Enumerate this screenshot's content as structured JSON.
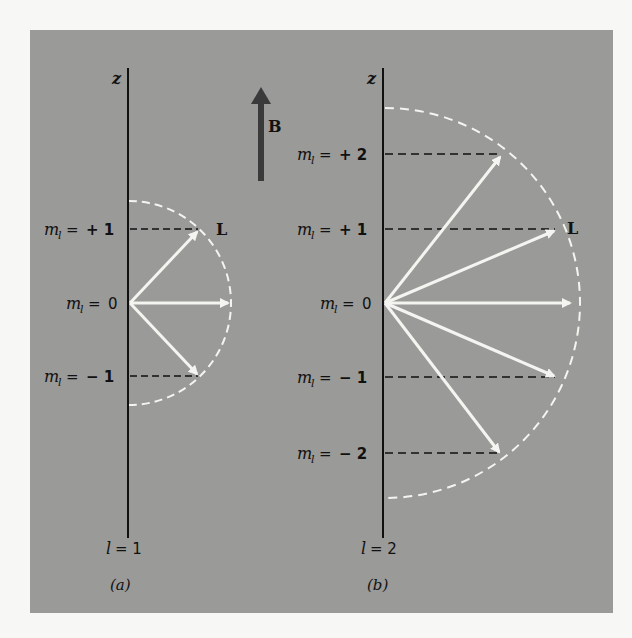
{
  "figure": {
    "background_color": "#9a9a98",
    "page_color": "#f7f7f5",
    "axis_color": "#111111",
    "vector_color": "#f4f4f0",
    "field_arrow_color": "#3a3a3a",
    "field_label": "B",
    "vector_label": "L",
    "axis_label": "z"
  },
  "panel_a": {
    "caption": "(a)",
    "l_label": "l = 1",
    "l_value": 1,
    "levels": [
      {
        "m": "+ 1",
        "label": "m_l = + 1",
        "value": 1
      },
      {
        "m": "0",
        "label": "m_l = 0",
        "value": 0
      },
      {
        "m": "− 1",
        "label": "m_l = − 1",
        "value": -1
      }
    ]
  },
  "panel_b": {
    "caption": "(b)",
    "l_label": "l = 2",
    "l_value": 2,
    "levels": [
      {
        "m": "+ 2",
        "label": "m_l = + 2",
        "value": 2
      },
      {
        "m": "+ 1",
        "label": "m_l = + 1",
        "value": 1
      },
      {
        "m": "0",
        "label": "m_l = 0",
        "value": 0
      },
      {
        "m": "− 1",
        "label": "m_l = − 1",
        "value": -1
      },
      {
        "m": "− 2",
        "label": "m_l = − 2",
        "value": -2
      }
    ]
  },
  "labels": {
    "m": "m",
    "sub": "l",
    "eq": " = ",
    "l_prefix": "l",
    "l1": "= 1",
    "l2": "= 2",
    "m_plus1": "+ 1",
    "m_zero": "0",
    "m_minus1": "− 1",
    "m_plus2": "+ 2",
    "m_minus2": "− 2"
  }
}
